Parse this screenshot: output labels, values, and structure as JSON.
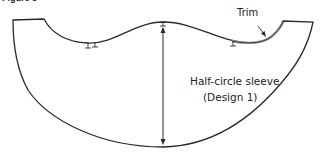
{
  "figure": {
    "caption": "Figure 3"
  },
  "pattern": {
    "name": "half-circle-sleeve-pattern",
    "stroke_color": "#2a2a2a",
    "trim_color": "#888888"
  },
  "labels": {
    "trim": "Trim",
    "sleeve_line1": "Half-circle sleeve",
    "sleeve_line2": "(Design 1)"
  }
}
